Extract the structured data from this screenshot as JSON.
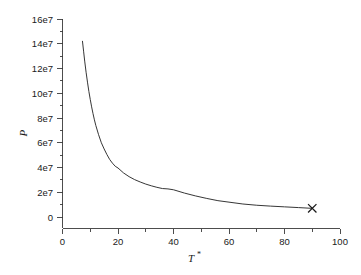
{
  "chart_data": {
    "type": "line",
    "title": "",
    "xlabel": "T*",
    "ylabel": "P",
    "xlabel_base": "T",
    "xlabel_sup": "*",
    "xlim": [
      0,
      100
    ],
    "ylim": [
      0,
      160000000
    ],
    "grid": false,
    "legend": null,
    "x_ticks": [
      0,
      20,
      40,
      60,
      80,
      100
    ],
    "x_tick_labels": [
      "0",
      "20",
      "40",
      "60",
      "80",
      "100"
    ],
    "x_minor_ticks": [
      10,
      30,
      50,
      70,
      90
    ],
    "y_ticks": [
      0,
      20000000,
      40000000,
      60000000,
      80000000,
      100000000,
      120000000,
      140000000,
      160000000
    ],
    "y_tick_labels": [
      "0",
      "2e7",
      "4e7",
      "6e7",
      "8e7",
      "10e7",
      "12e7",
      "14e7",
      "16e7"
    ],
    "y_minor_ticks": [
      10000000,
      30000000,
      50000000,
      70000000,
      90000000,
      110000000,
      130000000,
      150000000
    ],
    "series": [
      {
        "name": "P",
        "style": "solid-line",
        "color": "#2b2b2b",
        "x": [
          7.2,
          7.6,
          8.0,
          8.5,
          9.0,
          9.5,
          10.0,
          10.5,
          11.0,
          11.5,
          12.0,
          13.0,
          14.0,
          15.0,
          16.0,
          17.0,
          18.0,
          19.0,
          20.0,
          22.0,
          24.0,
          26.0,
          28.0,
          30.0,
          32.0,
          34.0,
          36.0,
          38.0,
          40.0,
          44.0,
          48.0,
          52.0,
          56.0,
          60.0,
          65.0,
          70.0,
          75.0,
          80.0,
          85.0,
          90.0
        ],
        "y": [
          142000000,
          134000000,
          126000000,
          117000000,
          109000000,
          101500000,
          95000000,
          89000000,
          83500000,
          78500000,
          74000000,
          66500000,
          60000000,
          55000000,
          50500000,
          46500000,
          43500000,
          41000000,
          39600000,
          35600000,
          32600000,
          30200000,
          28300000,
          26600000,
          25200000,
          24000000,
          23000000,
          22700000,
          22000000,
          19300000,
          17000000,
          15000000,
          13200000,
          12000000,
          10500000,
          9500000,
          8800000,
          8200000,
          7600000,
          7000000
        ]
      }
    ],
    "markers": [
      {
        "name": "critical-point-marker",
        "symbol": "x",
        "x": 90,
        "y": 7000000,
        "color": "#1a1a1a"
      }
    ]
  }
}
